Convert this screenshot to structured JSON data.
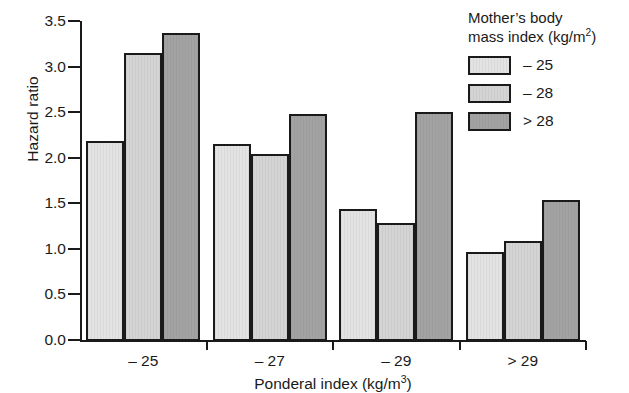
{
  "chart_data": {
    "type": "bar",
    "title": "",
    "xlabel": "Ponderal index (kg/m3)",
    "xlabel_base": "Ponderal index (kg/m",
    "xlabel_sup": "3",
    "xlabel_tail": ")",
    "ylabel": "Hazard ratio",
    "categories": [
      "– 25",
      "– 27",
      "– 29",
      "> 29"
    ],
    "series": [
      {
        "name": "– 25",
        "color": "#e3e3e3",
        "values": [
          2.2,
          2.16,
          1.45,
          0.98
        ]
      },
      {
        "name": "– 28",
        "color": "#d4d4d4",
        "values": [
          3.16,
          2.05,
          1.29,
          1.1
        ]
      },
      {
        "name": "> 28",
        "color": "#a3a3a3",
        "values": [
          3.38,
          2.49,
          2.51,
          1.55
        ]
      }
    ],
    "ylim": [
      0.0,
      3.5
    ],
    "yticks": [
      "0.0",
      "0.5",
      "1.0",
      "1.5",
      "2.0",
      "2.5",
      "3.0",
      "3.5"
    ],
    "ytick_values": [
      0.0,
      0.5,
      1.0,
      1.5,
      2.0,
      2.5,
      3.0,
      3.5
    ],
    "grid": false,
    "legend_position": "top-right"
  },
  "legend": {
    "title_line1": "Mother’s body",
    "title_line2_base": "mass index (kg/m",
    "title_line2_sup": "2",
    "title_line2_tail": ")",
    "entries": [
      {
        "label": "– 25",
        "color": "#e3e3e3"
      },
      {
        "label": "– 28",
        "color": "#d4d4d4"
      },
      {
        "label": "> 28",
        "color": "#a3a3a3"
      }
    ]
  }
}
